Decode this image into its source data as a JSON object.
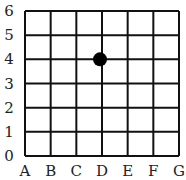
{
  "grid": {
    "x_labels": [
      "A",
      "B",
      "C",
      "D",
      "E",
      "F",
      "G"
    ],
    "y_labels": [
      "0",
      "1",
      "2",
      "3",
      "4",
      "5",
      "6"
    ],
    "line_color": "#111111"
  },
  "point": {
    "x": "D",
    "y": "4",
    "color": "#000000"
  }
}
